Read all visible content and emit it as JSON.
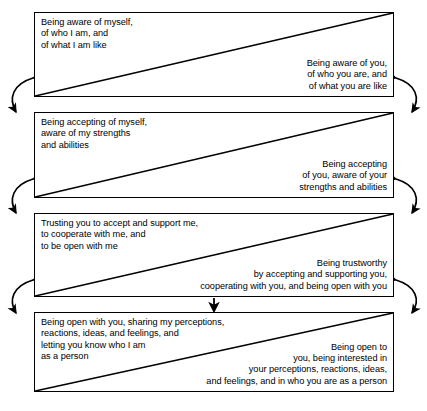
{
  "diagram": {
    "background_color": "#ffffff",
    "line_color": "#000000",
    "panels": [
      {
        "id": "awareness",
        "self_text": "Being aware of myself,\nof who I am, and\nof what I am like",
        "other_text": "Being aware of you,\nof who you are, and\nof what you are like"
      },
      {
        "id": "acceptance",
        "self_text": "Being accepting of myself,\naware of my strengths\nand abilities",
        "other_text": "Being accepting\nof you, aware of your\nstrengths and abilities"
      },
      {
        "id": "trust",
        "self_text": "Trusting you to accept and support me,\nto cooperate with me, and\nto be open with me",
        "other_text": "Being trustworthy\nby accepting and supporting you,\ncooperating with you, and being open with you"
      },
      {
        "id": "openness",
        "self_text": "Being open with you, sharing my perceptions,\nreactions, ideas, and feelings, and\nletting you know who I am\nas a person",
        "other_text": "Being open to\nyou, being interested in\nyour perceptions, reactions, ideas,\nand feelings, and in who you are as a person"
      }
    ],
    "connectors": [
      {
        "id": "left-link-1-2",
        "side": "left",
        "kind": "double-headed-curved-arrow"
      },
      {
        "id": "left-link-2-3",
        "side": "left",
        "kind": "double-headed-curved-arrow"
      },
      {
        "id": "left-link-3-4",
        "side": "left",
        "kind": "double-headed-curved-arrow"
      },
      {
        "id": "right-link-1-2",
        "side": "right",
        "kind": "double-headed-curved-arrow"
      },
      {
        "id": "right-link-2-3",
        "side": "right",
        "kind": "double-headed-curved-arrow"
      },
      {
        "id": "right-link-3-4",
        "side": "right",
        "kind": "double-headed-curved-arrow"
      },
      {
        "id": "center-link-3-4",
        "side": "center",
        "kind": "down-arrow"
      }
    ]
  }
}
